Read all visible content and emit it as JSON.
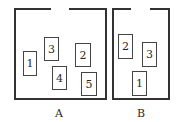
{
  "figure": {
    "type": "diagram",
    "line_color": "#333333",
    "background": "#ffffff"
  },
  "containers": [
    {
      "label": "A",
      "items": [
        {
          "id": "1",
          "x": 23,
          "y": 51,
          "w": 14,
          "h": 25
        },
        {
          "id": "3",
          "x": 44,
          "y": 37,
          "w": 15,
          "h": 24
        },
        {
          "id": "4",
          "x": 52,
          "y": 66,
          "w": 15,
          "h": 24
        },
        {
          "id": "2",
          "x": 75,
          "y": 43,
          "w": 16,
          "h": 24
        },
        {
          "id": "5",
          "x": 81,
          "y": 72,
          "w": 16,
          "h": 24
        }
      ]
    },
    {
      "label": "B",
      "items": [
        {
          "id": "2",
          "x": 118,
          "y": 34,
          "w": 15,
          "h": 25
        },
        {
          "id": "3",
          "x": 142,
          "y": 42,
          "w": 15,
          "h": 25
        },
        {
          "id": "1",
          "x": 132,
          "y": 71,
          "w": 15,
          "h": 25
        }
      ]
    }
  ]
}
